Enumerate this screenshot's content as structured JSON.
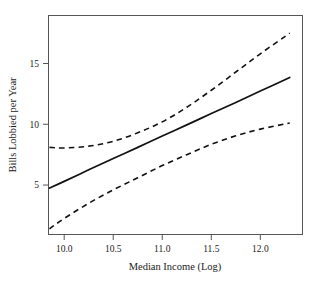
{
  "chart_data": {
    "type": "line",
    "title": "",
    "subtitle": "",
    "xlabel": "Median Income (Log)",
    "ylabel": "Bills Lobbied per Year",
    "xlim": [
      9.84,
      12.43
    ],
    "ylim": [
      0.93,
      18.95
    ],
    "xticks": [
      10.0,
      10.5,
      11.0,
      11.5,
      12.0
    ],
    "xticklabels": [
      "10.0",
      "10.5",
      "11.0",
      "11.5",
      "12.0"
    ],
    "yticks": [
      5,
      10,
      15
    ],
    "yticklabels": [
      "5",
      "10",
      "15"
    ],
    "grid": false,
    "legend": null,
    "frame": "box",
    "line_color": "#111111",
    "series": [
      {
        "name": "Predicted bills lobbied (fit)",
        "style": "solid",
        "x": [
          9.85,
          10.0,
          10.25,
          10.5,
          10.75,
          11.0,
          11.25,
          11.5,
          11.75,
          12.0,
          12.3
        ],
        "values": [
          4.75,
          5.3,
          6.25,
          7.18,
          8.1,
          9.03,
          9.95,
          10.88,
          11.8,
          12.73,
          13.85
        ]
      },
      {
        "name": "Upper 95% confidence bound",
        "style": "dashed",
        "x": [
          9.85,
          10.0,
          10.25,
          10.5,
          10.75,
          11.0,
          11.25,
          11.5,
          11.75,
          12.0,
          12.3
        ],
        "values": [
          8.1,
          8.05,
          8.2,
          8.6,
          9.3,
          10.2,
          11.4,
          12.8,
          14.3,
          15.8,
          17.5
        ]
      },
      {
        "name": "Lower 95% confidence bound",
        "style": "dashed",
        "x": [
          9.85,
          10.0,
          10.25,
          10.5,
          10.75,
          11.0,
          11.25,
          11.5,
          11.75,
          12.0,
          12.3
        ],
        "values": [
          1.4,
          2.25,
          3.5,
          4.6,
          5.6,
          6.6,
          7.5,
          8.35,
          9.05,
          9.6,
          10.1
        ]
      }
    ]
  }
}
